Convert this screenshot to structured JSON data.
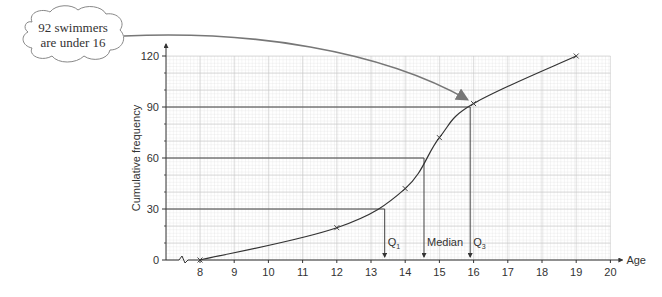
{
  "chart_data": {
    "type": "line",
    "title": "",
    "xlabel": "Age",
    "ylabel": "Cumulative frequency",
    "xlim": [
      7,
      20
    ],
    "ylim": [
      0,
      120
    ],
    "x_ticks": [
      8,
      9,
      10,
      11,
      12,
      13,
      14,
      15,
      16,
      17,
      18,
      19,
      20
    ],
    "y_ticks": [
      0,
      30,
      60,
      90,
      120
    ],
    "axis_break": true,
    "grid": true,
    "series": [
      {
        "name": "Cumulative frequency curve",
        "points": [
          {
            "x": 8,
            "y": 0
          },
          {
            "x": 12,
            "y": 19
          },
          {
            "x": 14,
            "y": 42
          },
          {
            "x": 15,
            "y": 72
          },
          {
            "x": 16,
            "y": 92
          },
          {
            "x": 19,
            "y": 120
          }
        ]
      }
    ],
    "reference_lines": [
      {
        "label": "Q1",
        "x": 13.4,
        "y": 30
      },
      {
        "label": "Median",
        "x": 14.55,
        "y": 60
      },
      {
        "label": "Q3",
        "x": 15.9,
        "y": 90
      }
    ],
    "annotation": {
      "line1": "92 swimmers",
      "line2": "are under 16",
      "points_to": {
        "x": 16,
        "y": 92
      }
    }
  }
}
